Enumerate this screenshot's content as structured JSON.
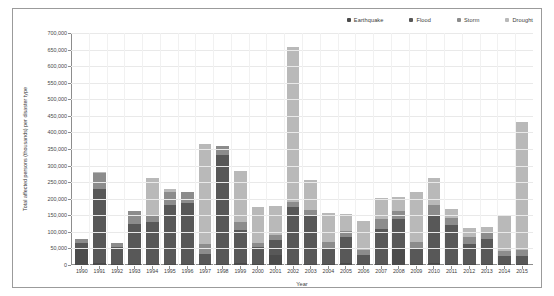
{
  "chart_data": {
    "type": "bar",
    "stacked": true,
    "title": "",
    "xlabel": "Year",
    "ylabel": "Total affected persons (thousands) per disaster type",
    "ylim": [
      0,
      700000
    ],
    "ytick_step": 50000,
    "grid": true,
    "legend_position": "top-right",
    "ytick_labels": [
      "0",
      "50,000",
      "100,000",
      "150,000",
      "200,000",
      "250,000",
      "300,000",
      "350,000",
      "400,000",
      "450,000",
      "500,000",
      "550,000",
      "600,000",
      "650,000",
      "700,000"
    ],
    "categories": [
      "1990",
      "1991",
      "1992",
      "1993",
      "1994",
      "1995",
      "1996",
      "1997",
      "1998",
      "1999",
      "2000",
      "2001",
      "2002",
      "2003",
      "2004",
      "2005",
      "2006",
      "2007",
      "2008",
      "2009",
      "2010",
      "2011",
      "2012",
      "2013",
      "2014",
      "2015"
    ],
    "series": [
      {
        "name": "Earthquake",
        "color": "#4b4b4b",
        "values": [
          52000,
          5000,
          3000,
          4000,
          2000,
          4000,
          3000,
          2000,
          3000,
          5000,
          3000,
          30000,
          2000,
          2000,
          3000,
          5000,
          3000,
          3000,
          48000,
          3000,
          5000,
          2000,
          3000,
          2000,
          2000,
          3000
        ]
      },
      {
        "name": "Flood",
        "color": "#585858",
        "values": [
          14000,
          225000,
          50000,
          120000,
          128000,
          178000,
          185000,
          30000,
          330000,
          100000,
          52000,
          45000,
          172000,
          145000,
          45000,
          80000,
          28000,
          105000,
          90000,
          45000,
          145000,
          120000,
          60000,
          78000,
          25000,
          25000
        ]
      },
      {
        "name": "Storm",
        "color": "#8c8c8c",
        "values": [
          12000,
          48000,
          14000,
          40000,
          18000,
          38000,
          32000,
          32000,
          25000,
          25000,
          12000,
          15000,
          15000,
          20000,
          20000,
          18000,
          15000,
          30000,
          25000,
          22000,
          30000,
          20000,
          22000,
          18000,
          15000,
          18000
        ]
      },
      {
        "name": "Drought",
        "color": "#b9b9b9",
        "values": [
          0,
          2000,
          0,
          0,
          115000,
          10000,
          0,
          300000,
          0,
          155000,
          108000,
          88000,
          470000,
          90000,
          90000,
          52000,
          88000,
          65000,
          42000,
          150000,
          82000,
          26000,
          28000,
          18000,
          105000,
          385000
        ]
      }
    ]
  }
}
